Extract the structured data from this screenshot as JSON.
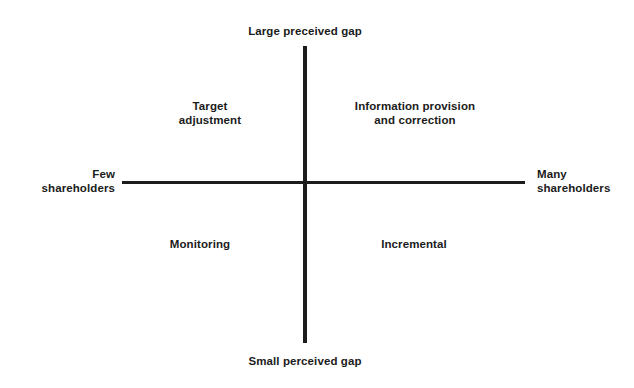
{
  "chart_data": {
    "type": "diagram",
    "diagram_kind": "2x2-quadrant-matrix",
    "title": "",
    "axes": {
      "vertical": {
        "top_label": "Large preceived gap",
        "bottom_label": "Small perceived gap",
        "dimension": "perceived gap"
      },
      "horizontal": {
        "left_label": "Few\nshareholders",
        "right_label": "Many\nshareholders",
        "dimension": "number of shareholders"
      }
    },
    "quadrants": [
      {
        "position": "top-left",
        "label": "Target\nadjustment",
        "x": "few shareholders",
        "y": "large perceived gap"
      },
      {
        "position": "top-right",
        "label": "Information provision\nand correction",
        "x": "many shareholders",
        "y": "large perceived gap"
      },
      {
        "position": "bottom-left",
        "label": "Monitoring",
        "x": "few shareholders",
        "y": "small perceived gap"
      },
      {
        "position": "bottom-right",
        "label": "Incremental",
        "x": "many shareholders",
        "y": "small perceived gap"
      }
    ],
    "colors": {
      "background": "#ffffff",
      "axis": "#1c1c1c",
      "text": "#1b1b1b"
    },
    "grid": false,
    "legend": false
  }
}
